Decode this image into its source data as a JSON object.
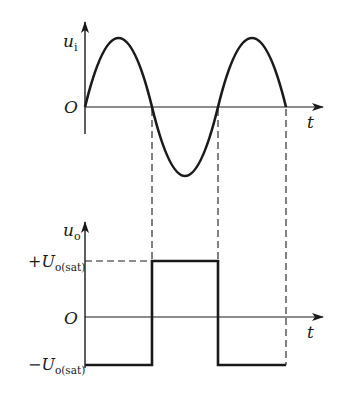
{
  "diagram": {
    "type": "waveform-comparison",
    "colors": {
      "stroke": "#1a1a1a",
      "background": "#ffffff"
    }
  },
  "top_plot": {
    "y_label_main": "u",
    "y_label_sub": "i",
    "origin_label": "O",
    "x_label": "t",
    "signal": "sine",
    "zero_crossings_px": [
      85,
      152,
      218,
      286
    ]
  },
  "bottom_plot": {
    "y_label_main": "u",
    "y_label_sub": "o",
    "origin_label": "O",
    "x_label": "t",
    "pos_level": {
      "sign": "+",
      "main": "U",
      "sub": "o(sat)"
    },
    "neg_level": {
      "sign": "−",
      "main": "U",
      "sub": "o(sat)"
    },
    "signal": "square",
    "segments": [
      {
        "from": 85,
        "to": 152,
        "level": "negative"
      },
      {
        "from": 152,
        "to": 218,
        "level": "positive"
      },
      {
        "from": 218,
        "to": 286,
        "level": "negative"
      }
    ]
  }
}
